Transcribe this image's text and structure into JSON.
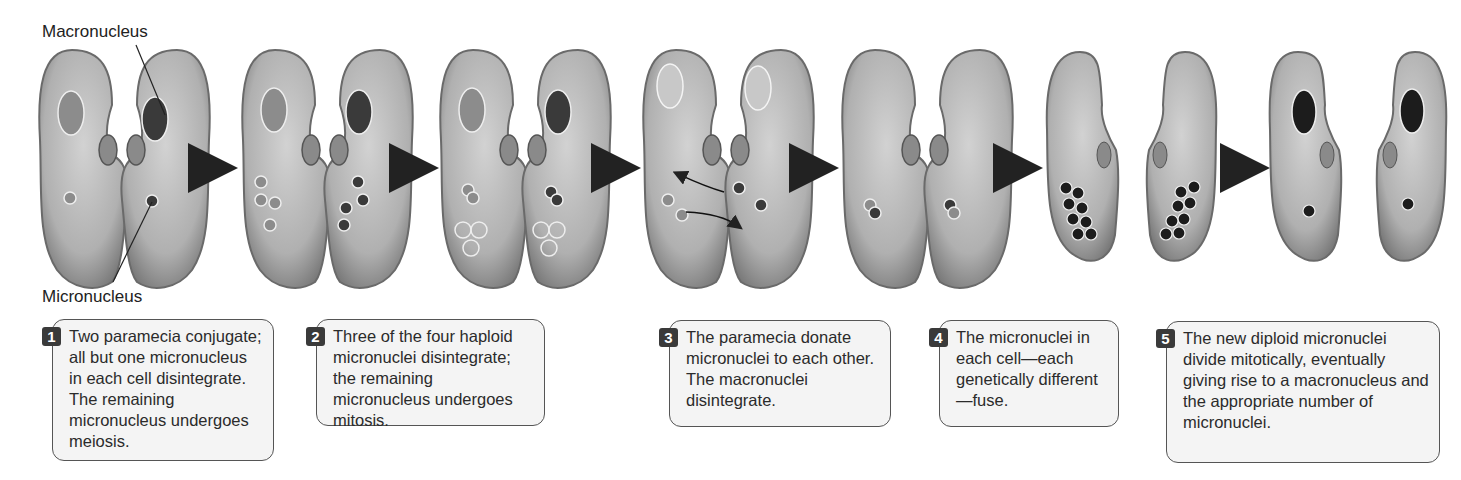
{
  "labels": {
    "macronucleus": "Macronucleus",
    "micronucleus": "Micronucleus"
  },
  "steps": [
    {
      "number": "1",
      "text": "Two paramecia conjugate; all but one micronucleus in each cell disintegrate. The remaining micronucleus undergoes meiosis."
    },
    {
      "number": "2",
      "text": "Three of the four haploid micronuclei disintegrate; the remaining micronucleus undergoes mitosis."
    },
    {
      "number": "3",
      "text": "The paramecia donate micronuclei to each other. The macronuclei disintegrate."
    },
    {
      "number": "4",
      "text": "The micronuclei in each cell—each genetically different—fuse."
    },
    {
      "number": "5",
      "text": "The new diploid micronuclei divide mitotically, eventually giving rise to a macronucleus and the appropriate number of micronuclei."
    }
  ],
  "colors": {
    "cell_body": "#b5b5b5",
    "cell_edge": "#6a6a6a",
    "nucleus_light": "#8c8c8c",
    "nucleus_dark": "#3a3a3a",
    "nucleus_black": "#1c1c1c",
    "arrow": "#2a2a2a",
    "box_bg": "#f4f4f4",
    "badge_bg": "#3a3a3a"
  }
}
